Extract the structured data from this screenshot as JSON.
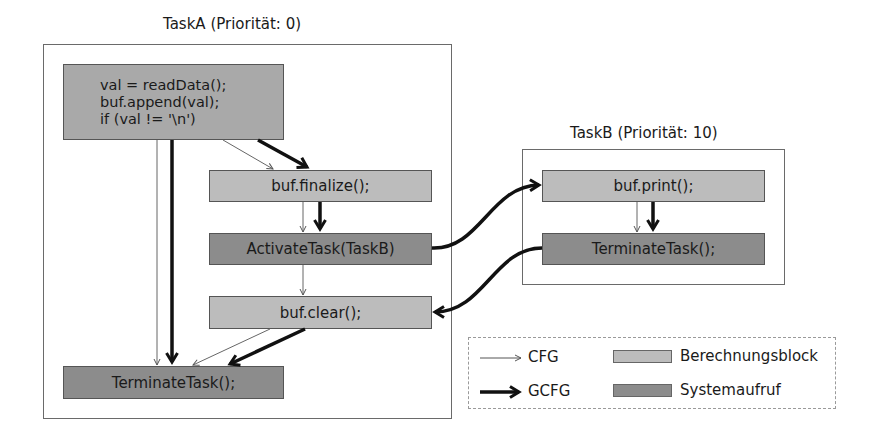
{
  "colors": {
    "computation_block": "#bcbcbc",
    "syscall_block": "#8c8c8c",
    "first_block": "#a9a9a9",
    "edge": "#111111"
  },
  "taskA": {
    "title": "TaskA (Priorität: 0)",
    "blocks": [
      {
        "id": "a1",
        "type": "computation",
        "lines": [
          "val = readData();",
          "buf.append(val);",
          "if (val != '\\n')"
        ]
      },
      {
        "id": "a2",
        "type": "computation",
        "label": "buf.finalize();"
      },
      {
        "id": "a3",
        "type": "syscall",
        "label": "ActivateTask(TaskB)"
      },
      {
        "id": "a4",
        "type": "computation",
        "label": "buf.clear();"
      },
      {
        "id": "a5",
        "type": "syscall",
        "label": "TerminateTask();"
      }
    ]
  },
  "taskB": {
    "title": "TaskB (Priorität: 10)",
    "blocks": [
      {
        "id": "b1",
        "type": "computation",
        "label": "buf.print();"
      },
      {
        "id": "b2",
        "type": "syscall",
        "label": "TerminateTask();"
      }
    ]
  },
  "edges": {
    "cfg": [
      [
        "a1",
        "a2"
      ],
      [
        "a1",
        "a5"
      ],
      [
        "a2",
        "a3"
      ],
      [
        "a3",
        "a4"
      ],
      [
        "a4",
        "a5"
      ],
      [
        "b1",
        "b2"
      ]
    ],
    "gcfg": [
      [
        "a1",
        "a2"
      ],
      [
        "a1",
        "a5"
      ],
      [
        "a2",
        "a3"
      ],
      [
        "a3",
        "b1"
      ],
      [
        "b1",
        "b2"
      ],
      [
        "b2",
        "a4"
      ],
      [
        "a4",
        "a5"
      ]
    ]
  },
  "legend": {
    "cfg_label": "CFG",
    "gcfg_label": "GCFG",
    "computation_label": "Berechnungsblock",
    "syscall_label": "Systemaufruf"
  }
}
